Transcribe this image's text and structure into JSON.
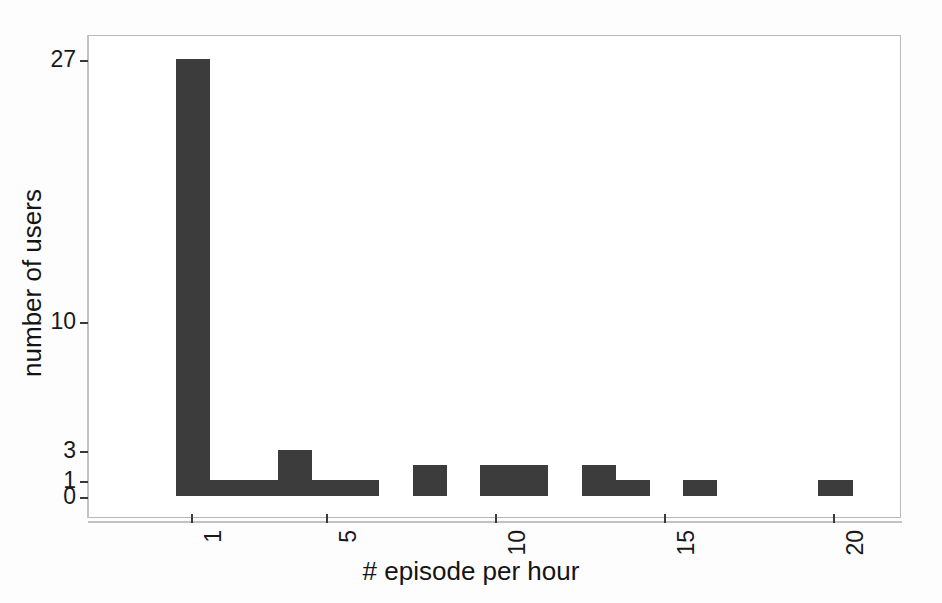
{
  "chart_data": {
    "type": "bar",
    "title": "",
    "subtitle": "",
    "xlabel": "# episode per hour",
    "ylabel": "number of users",
    "grid": false,
    "legend": null,
    "y_scale": "custom (compressed / log-like)",
    "ylim": [
      0,
      27
    ],
    "xlim": [
      0.5,
      21.5
    ],
    "x_tick_labels": [
      "1",
      "5",
      "10",
      "15",
      "20"
    ],
    "x_tick_values": [
      1,
      5,
      10,
      15,
      20
    ],
    "y_tick_labels": [
      "0",
      "1",
      "3",
      "10",
      "27"
    ],
    "y_tick_values": [
      0,
      1,
      3,
      10,
      27
    ],
    "bar_color": "#3c3c3c",
    "categories": [
      1,
      2,
      3,
      4,
      5,
      6,
      7,
      8,
      9,
      10,
      11,
      12,
      13,
      14,
      15,
      16,
      17,
      18,
      19,
      20,
      21
    ],
    "values": [
      27,
      1,
      1,
      3,
      1,
      1,
      0,
      2,
      0,
      2,
      2,
      0,
      2,
      1,
      0,
      1,
      0,
      0,
      0,
      1,
      0
    ],
    "bars": [
      {
        "x": 1,
        "value": 27
      },
      {
        "x": 2,
        "value": 1
      },
      {
        "x": 3,
        "value": 1
      },
      {
        "x": 4,
        "value": 3
      },
      {
        "x": 5,
        "value": 1
      },
      {
        "x": 6,
        "value": 1
      },
      {
        "x": 7,
        "value": 0
      },
      {
        "x": 8,
        "value": 2
      },
      {
        "x": 9,
        "value": 0
      },
      {
        "x": 10,
        "value": 2
      },
      {
        "x": 11,
        "value": 2
      },
      {
        "x": 12,
        "value": 0
      },
      {
        "x": 13,
        "value": 2
      },
      {
        "x": 14,
        "value": 1
      },
      {
        "x": 15,
        "value": 0
      },
      {
        "x": 16,
        "value": 1
      },
      {
        "x": 17,
        "value": 0
      },
      {
        "x": 18,
        "value": 0
      },
      {
        "x": 19,
        "value": 0
      },
      {
        "x": 20,
        "value": 1
      },
      {
        "x": 21,
        "value": 0
      }
    ]
  },
  "axes": {
    "x_title": "# episode per hour",
    "y_title": "number of users",
    "x_ticks": [
      {
        "label": "1",
        "value": 1
      },
      {
        "label": "5",
        "value": 5
      },
      {
        "label": "10",
        "value": 10
      },
      {
        "label": "15",
        "value": 15
      },
      {
        "label": "20",
        "value": 20
      }
    ],
    "y_ticks": [
      {
        "label": "0",
        "value": 0
      },
      {
        "label": "1",
        "value": 1
      },
      {
        "label": "3",
        "value": 3
      },
      {
        "label": "10",
        "value": 10
      },
      {
        "label": "27",
        "value": 27
      }
    ]
  },
  "colors": {
    "bar": "#3c3c3c",
    "frame": "#b9b9b9",
    "text": "#191919",
    "background": "#ffffff"
  }
}
